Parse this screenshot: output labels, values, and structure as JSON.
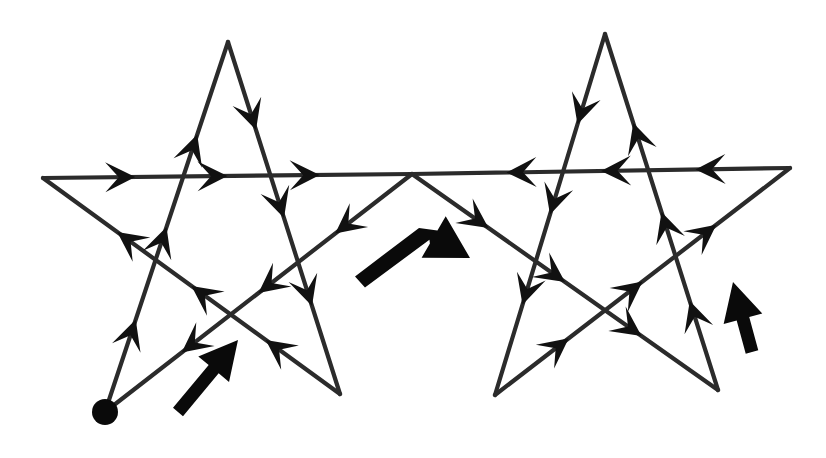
{
  "figure": {
    "background_color": "#ffffff",
    "stroke_color": "#2b2b2b",
    "arrow_color": "#111111",
    "pointer_color": "#0a0a0a",
    "canvas": {
      "width": 826,
      "height": 458
    },
    "start_marker": {
      "name": "start-dot",
      "x": 105,
      "y": 412,
      "radius": 13
    },
    "left_star": {
      "name": "left-star",
      "vertices": [
        {
          "label": "left-point",
          "x": 43,
          "y": 178
        },
        {
          "label": "top-point",
          "x": 228,
          "y": 42
        },
        {
          "label": "right-point",
          "x": 412,
          "y": 174
        },
        {
          "label": "bottom-left",
          "x": 105,
          "y": 412
        },
        {
          "label": "bottom-right",
          "x": 340,
          "y": 394
        }
      ],
      "segments": [
        {
          "from": "bottom-left",
          "to": "top-point",
          "x1": 105,
          "y1": 412,
          "x2": 228,
          "y2": 42,
          "arrows": 3
        },
        {
          "from": "top-point",
          "to": "bottom-right",
          "x1": 228,
          "y1": 42,
          "x2": 340,
          "y2": 394,
          "arrows": 3
        },
        {
          "from": "bottom-right",
          "to": "left-point",
          "x1": 340,
          "y1": 394,
          "x2": 43,
          "y2": 178,
          "arrows": 3
        },
        {
          "from": "left-point",
          "to": "right-point",
          "x1": 43,
          "y1": 178,
          "x2": 412,
          "y2": 174,
          "arrows": 3
        },
        {
          "from": "right-point",
          "to": "bottom-left",
          "x1": 412,
          "y1": 174,
          "x2": 105,
          "y2": 412,
          "arrows": 3
        }
      ]
    },
    "right_star": {
      "name": "right-star",
      "vertices": [
        {
          "label": "left-point",
          "x": 412,
          "y": 174
        },
        {
          "label": "top-point",
          "x": 605,
          "y": 34
        },
        {
          "label": "right-point",
          "x": 790,
          "y": 168
        },
        {
          "label": "bottom-left",
          "x": 495,
          "y": 395
        },
        {
          "label": "bottom-right",
          "x": 718,
          "y": 390
        }
      ],
      "segments": [
        {
          "from": "left-point",
          "to": "bottom-right",
          "x1": 412,
          "y1": 174,
          "x2": 718,
          "y2": 390,
          "arrows": 3
        },
        {
          "from": "bottom-right",
          "to": "top-point",
          "x1": 718,
          "y1": 390,
          "x2": 605,
          "y2": 34,
          "arrows": 3
        },
        {
          "from": "top-point",
          "to": "bottom-left",
          "x1": 605,
          "y1": 34,
          "x2": 495,
          "y2": 395,
          "arrows": 3
        },
        {
          "from": "bottom-left",
          "to": "right-point",
          "x1": 495,
          "y1": 395,
          "x2": 790,
          "y2": 168,
          "arrows": 3
        },
        {
          "from": "right-point",
          "to": "left-point",
          "x1": 790,
          "y1": 168,
          "x2": 412,
          "y2": 174,
          "arrows": 3
        }
      ]
    },
    "pointer_arrows": [
      {
        "name": "pointer-arrow-left",
        "kind": "straight",
        "direction": "up-right",
        "x1": 178,
        "y1": 412,
        "x2": 238,
        "y2": 340,
        "shaft_width": 13,
        "head_length": 38,
        "head_width": 40
      },
      {
        "name": "pointer-arrow-center",
        "kind": "bent",
        "direction": "right-down",
        "points": [
          [
            360,
            282
          ],
          [
            420,
            229
          ],
          [
            470,
            258
          ]
        ],
        "shaft_width": 15,
        "head_length": 42,
        "head_width": 48
      },
      {
        "name": "pointer-arrow-right",
        "kind": "straight",
        "direction": "up-left",
        "x1": 752,
        "y1": 352,
        "x2": 733,
        "y2": 282,
        "shaft_width": 13,
        "head_length": 38,
        "head_width": 40
      }
    ]
  }
}
